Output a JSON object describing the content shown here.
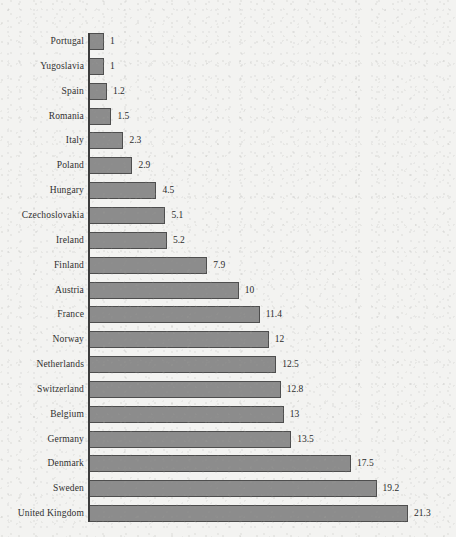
{
  "chart_data": {
    "type": "bar",
    "orientation": "horizontal",
    "title": "",
    "subtitle": "",
    "xlabel": "",
    "ylabel": "",
    "grid": false,
    "legend": null,
    "xlim": [
      0,
      21.3
    ],
    "axis_line": "vertical-left",
    "value_labels_shown": true,
    "categories": [
      "Portugal",
      "Yugoslavia",
      "Spain",
      "Romania",
      "Italy",
      "Poland",
      "Hungary",
      "Czechoslovakia",
      "Ireland",
      "Finland",
      "Austria",
      "France",
      "Norway",
      "Netherlands",
      "Switzerland",
      "Belgium",
      "Germany",
      "Denmark",
      "Sweden",
      "United Kingdom"
    ],
    "values": [
      1,
      1,
      1.2,
      1.5,
      2.3,
      2.9,
      4.5,
      5.1,
      5.2,
      7.9,
      10,
      11.4,
      12,
      12.5,
      12.8,
      13,
      13.5,
      17.5,
      19.2,
      21.3
    ],
    "value_label_texts": [
      "1",
      "1",
      "1.2",
      "1.5",
      "2.3",
      "2.9",
      "4.5",
      "5.1",
      "5.2",
      "7.9",
      "10",
      "11.4",
      "12",
      "12.5",
      "12.8",
      "13",
      "13.5",
      "17.5",
      "19.2",
      "21.3"
    ]
  },
  "style": {
    "bar_fill": "#8c8c8c",
    "bar_border": "#4e4e4e",
    "background": "#f3f3f1",
    "text_color": "#2e2e2e",
    "axis_color": "#3d3d3d"
  }
}
